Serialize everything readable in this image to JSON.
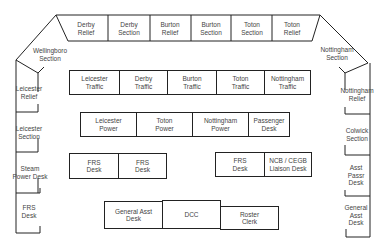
{
  "diagram": {
    "top_row": [
      "Derby\nRelief",
      "Derby\nSection",
      "Burton\nRelief",
      "Burton\nSection",
      "Toton\nSection",
      "Toton\nRelief"
    ],
    "left_corner": "Wellingboro\nSection",
    "right_corner": "Nottingham\nSection",
    "left_column": [
      "Leicester\nRelief",
      "Leicester\nSection",
      "Steam\nPower Desk",
      "FRS\nDesk"
    ],
    "right_column": [
      "Nottingham\nRelief",
      "Colwick\nSection",
      "Asst Passr\nDesk",
      "General\nAsst Desk"
    ],
    "traffic_row": [
      "Leicester\nTraffic",
      "Derby\nTraffic",
      "Burton\nTraffic",
      "Toton\nTraffic",
      "Nottingham\nTraffic"
    ],
    "power_row": [
      "Leicester\nPower",
      "Toton\nPower",
      "Nottingham\nPower",
      "Passenger\nDesk"
    ],
    "frs_left": [
      "FRS\nDesk",
      "FRS\nDesk"
    ],
    "frs_right": [
      "FRS\nDesk",
      "NCB / CEGB\nLiaison Desk"
    ],
    "bottom_row": [
      "General Asst\nDesk",
      "DCC",
      "Roster\nClerk"
    ]
  }
}
